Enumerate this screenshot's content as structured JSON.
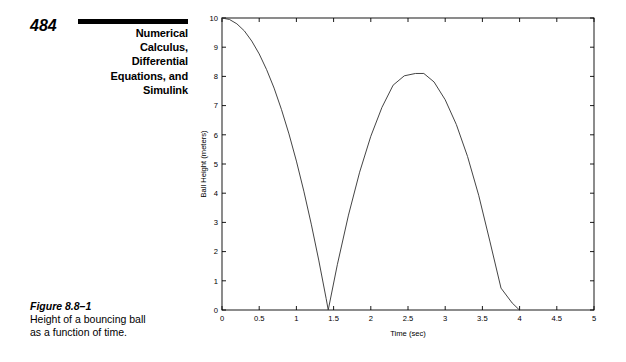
{
  "page": {
    "number": "484",
    "chapter_title_lines": [
      "Numerical",
      "Calculus,",
      "Differential",
      "Equations, and",
      "Simulink"
    ]
  },
  "figure": {
    "label": "Figure 8.8–1",
    "caption_lines": [
      "Height of a bouncing ball",
      "as a function of time."
    ]
  },
  "chart_data": {
    "type": "line",
    "title": "",
    "xlabel": "Time (sec)",
    "ylabel": "Ball Height (meters)",
    "xlim": [
      0,
      5
    ],
    "ylim": [
      0,
      10
    ],
    "xticks": [
      0,
      0.5,
      1,
      1.5,
      2,
      2.5,
      3,
      3.5,
      4,
      4.5,
      5
    ],
    "xticklabels": [
      "0",
      "0.5",
      "1",
      "1.5",
      "2",
      "2.5",
      "3",
      "3.5",
      "4",
      "4.5",
      "5"
    ],
    "yticks": [
      0,
      1,
      2,
      3,
      4,
      5,
      6,
      7,
      8,
      9,
      10
    ],
    "yticklabels": [
      "0",
      "1",
      "2",
      "3",
      "4",
      "5",
      "6",
      "7",
      "8",
      "9",
      "10"
    ],
    "grid": false,
    "legend": false,
    "line_color": "#3a3a3a",
    "series": [
      {
        "name": "Ball height",
        "x": [
          0.0,
          0.1,
          0.2,
          0.3,
          0.4,
          0.5,
          0.6,
          0.7,
          0.8,
          0.9,
          1.0,
          1.1,
          1.2,
          1.3,
          1.4,
          1.4278,
          1.55,
          1.7,
          1.85,
          2.0,
          2.15,
          2.3,
          2.45,
          2.6,
          2.7128,
          2.85,
          3.0,
          3.15,
          3.3,
          3.45,
          3.6,
          3.75,
          3.9,
          3.9978
        ],
        "y": [
          10.0,
          9.95,
          9.8,
          9.56,
          9.21,
          8.77,
          8.23,
          7.6,
          6.86,
          6.03,
          5.1,
          4.07,
          2.94,
          1.71,
          0.39,
          0.0,
          1.55,
          3.25,
          4.72,
          5.95,
          6.94,
          7.7,
          8.02,
          8.1,
          8.1,
          7.81,
          7.2,
          6.35,
          5.26,
          3.93,
          2.36,
          0.75,
          0.24,
          0.0
        ]
      }
    ],
    "annotations": {
      "drop_height_m": 10,
      "first_impact_sec": 1.43,
      "bounce_peak_m": 8.1,
      "bounce_peak_sec": 2.71,
      "second_impact_sec": 4.0
    }
  }
}
